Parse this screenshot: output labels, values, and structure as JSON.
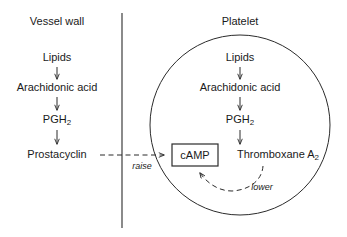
{
  "figure": {
    "background_color": "#ffffff",
    "line_color": "#2b2b2b",
    "text_color": "#1a1a1a"
  },
  "compartments": {
    "left": {
      "label": "Vessel wall",
      "divider_name": "vessel-wall-membrane"
    },
    "right": {
      "label": "Platelet",
      "outline_name": "platelet-cell-outline"
    }
  },
  "vessel_wall_pathway": {
    "steps": [
      {
        "label": "Lipids"
      },
      {
        "label": "Arachidonic acid"
      },
      {
        "label": "PGH",
        "sub": "2"
      },
      {
        "label": "Prostacyclin"
      }
    ]
  },
  "platelet_pathway": {
    "steps": [
      {
        "label": "Lipids"
      },
      {
        "label": "Arachidonic acid"
      },
      {
        "label": "PGH",
        "sub": "2"
      },
      {
        "label": "Thromboxane A",
        "sub": "2"
      }
    ]
  },
  "messenger": {
    "label": "cAMP"
  },
  "regulation": {
    "raise": {
      "label": "raise",
      "from": "Prostacyclin",
      "to": "cAMP",
      "style": "dashed"
    },
    "lower": {
      "label": "lower",
      "from": "Thromboxane A2",
      "to": "cAMP",
      "style": "dashed-curved"
    }
  }
}
